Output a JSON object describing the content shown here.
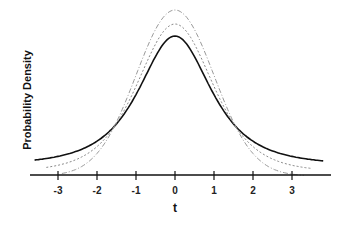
{
  "chart_data": {
    "type": "line",
    "title": "",
    "xlabel": "t",
    "ylabel": "Probability Density",
    "xlim": [
      -3.7,
      3.8
    ],
    "x_ticks": [
      -3,
      -2,
      -1,
      0,
      1,
      2,
      3
    ],
    "x_tick_labels": [
      "-3",
      "-2",
      "-1",
      "0",
      "1",
      "2",
      "3"
    ],
    "grid": false,
    "legend": null,
    "series": [
      {
        "name": "t-distribution (low df)",
        "style": "solid",
        "color": "#111111",
        "peak_relative": 0.72
      },
      {
        "name": "t-distribution (medium df)",
        "style": "dotted",
        "color": "#888888",
        "peak_relative": 0.83
      },
      {
        "name": "normal distribution",
        "style": "dash-dot",
        "color": "#999999",
        "peak_relative": 0.96
      }
    ]
  },
  "axis": {
    "xlabel": "t",
    "ylabel": "Probability Density",
    "ticks": [
      "-3",
      "-2",
      "-1",
      "0",
      "1",
      "2",
      "3"
    ]
  }
}
